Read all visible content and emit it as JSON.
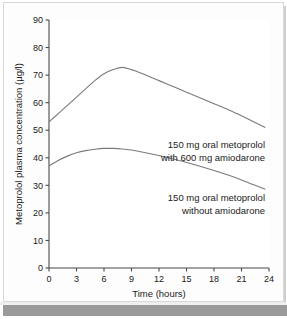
{
  "chart_data": {
    "type": "line",
    "title": "",
    "xlabel": "Time (hours)",
    "ylabel": "Metoprolol plasma concentration (µg/l)",
    "xlim": [
      0,
      24
    ],
    "ylim": [
      0,
      90
    ],
    "xticks": [
      "0",
      "3",
      "6",
      "9",
      "12",
      "15",
      "18",
      "21",
      "24"
    ],
    "yticks": [
      "0",
      "10",
      "20",
      "30",
      "40",
      "50",
      "60",
      "70",
      "80",
      "90"
    ],
    "grid": false,
    "legend_position": "inline-annotation",
    "series": [
      {
        "name": "150 mg oral metoprolol with 600 mg amiodarone",
        "x": [
          0,
          1,
          2,
          3,
          4,
          5,
          6,
          7,
          8,
          9,
          10,
          12,
          14,
          16,
          18,
          20,
          22,
          23.6
        ],
        "values": [
          53,
          56,
          59,
          62,
          65,
          68,
          70.5,
          72,
          72.8,
          72,
          70.8,
          68,
          65.2,
          62.4,
          59.6,
          56.8,
          53.6,
          51
        ]
      },
      {
        "name": "150 mg oral metoprolol without amiodarone",
        "x": [
          0,
          1,
          2,
          3,
          4,
          5,
          6,
          7,
          8,
          9,
          10,
          12,
          14,
          16,
          18,
          20,
          22,
          23.6
        ],
        "values": [
          37,
          39,
          40.6,
          41.8,
          42.6,
          43.1,
          43.4,
          43.4,
          43.2,
          42.8,
          42.2,
          40.8,
          39.2,
          37.4,
          35.4,
          33.2,
          30.6,
          28.6
        ]
      }
    ],
    "annotations": [
      {
        "name": "annotation-with-amiodarone",
        "line1": "150 mg oral metoprolol",
        "line2": "with 600 mg amiodarone"
      },
      {
        "name": "annotation-without-amiodarone",
        "line1": "150 mg oral metoprolol",
        "line2": "without amiodarone"
      }
    ],
    "colors": {
      "curve": "#7a7a7a",
      "axis": "#4a4a4a",
      "text": "#1a1a1a",
      "background": "#ffffff",
      "panel_border": "#d8d8d8",
      "bottom_band": "#9a9a9a"
    }
  }
}
